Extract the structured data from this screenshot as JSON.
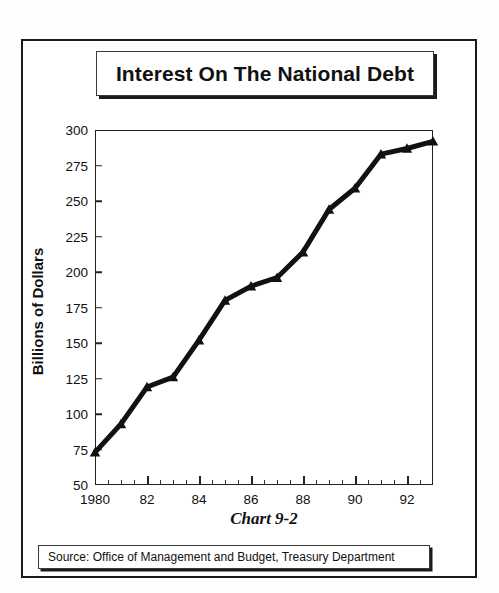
{
  "title": {
    "text": "Interest On The National Debt"
  },
  "caption": {
    "text": "Chart 9-2"
  },
  "source": {
    "text": "Source:  Office of Management and Budget, Treasury Department"
  },
  "chart_data": {
    "type": "line",
    "title": "Interest On The National Debt",
    "subtitle": "Chart 9-2",
    "xlabel": "",
    "ylabel": "Billions of Dollars",
    "ylim": [
      50,
      300
    ],
    "xlim": [
      1980,
      1993
    ],
    "ytick_step": 25,
    "yticks": [
      50,
      75,
      100,
      125,
      150,
      175,
      200,
      225,
      250,
      275,
      300
    ],
    "ytick_labels": [
      "50",
      "75",
      "100",
      "125",
      "150",
      "175",
      "200",
      "225",
      "250",
      "275",
      "300"
    ],
    "xticks": [
      1980,
      1982,
      1984,
      1986,
      1988,
      1990,
      1992
    ],
    "xtick_labels": [
      "1980",
      "82",
      "84",
      "86",
      "88",
      "90",
      "92"
    ],
    "xtick_minor_step": 0.5,
    "grid": false,
    "legend": "none",
    "marker": "triangle",
    "line_color": "#111111",
    "line_width_px": 5,
    "x": [
      1980,
      1981,
      1982,
      1983,
      1984,
      1985,
      1986,
      1987,
      1988,
      1989,
      1990,
      1991,
      1992,
      1993
    ],
    "values": [
      73,
      93,
      119,
      126,
      152,
      180,
      190,
      196,
      214,
      244,
      259,
      283,
      287,
      292
    ],
    "series": [
      {
        "name": "Interest on the national debt",
        "values": [
          73,
          93,
          119,
          126,
          152,
          180,
          190,
          196,
          214,
          244,
          259,
          283,
          287,
          292
        ]
      }
    ]
  }
}
